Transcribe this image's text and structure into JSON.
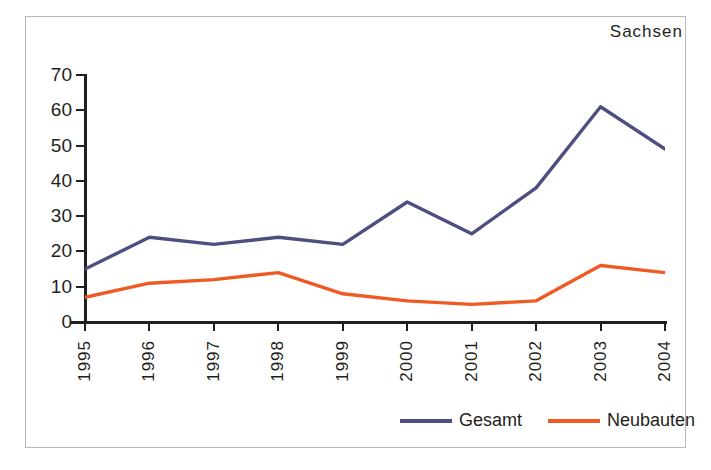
{
  "chart_data": {
    "type": "line",
    "title": "Sachsen",
    "xlabel": "",
    "ylabel": "",
    "x": [
      "1995",
      "1996",
      "1997",
      "1998",
      "1999",
      "2000",
      "2001",
      "2002",
      "2003",
      "2004"
    ],
    "categories": [
      "1995",
      "1996",
      "1997",
      "1998",
      "1999",
      "2000",
      "2001",
      "2002",
      "2003",
      "2004"
    ],
    "series": [
      {
        "name": "Gesamt",
        "color": "#4e4e83",
        "values": [
          15,
          24,
          22,
          24,
          22,
          34,
          25,
          38,
          61,
          49
        ]
      },
      {
        "name": "Neubauten",
        "color": "#ef5a24",
        "values": [
          7,
          11,
          12,
          14,
          8,
          6,
          5,
          6,
          16,
          14
        ]
      }
    ],
    "ylim": [
      0,
      70
    ],
    "y_ticks": [
      0,
      10,
      20,
      30,
      40,
      50,
      60,
      70
    ],
    "y_tick_labels": [
      "0",
      "10",
      "20",
      "30",
      "40",
      "50",
      "60",
      "70"
    ],
    "grid": false,
    "legend_position": "bottom-right",
    "legend_entries": [
      "Gesamt",
      "Neubauten"
    ]
  },
  "axis_color": "#231f20",
  "frame_color": "#b9b9b9",
  "background": "#ffffff"
}
